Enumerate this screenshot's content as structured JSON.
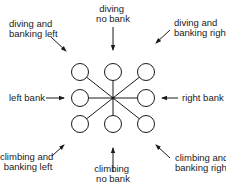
{
  "diagram": {
    "hub": {
      "x": 113,
      "y": 98
    },
    "circle_radius": 8.5,
    "stroke_color": "#1a1a1a",
    "nodes": [
      {
        "id": "tl",
        "x": 80,
        "y": 72
      },
      {
        "id": "tc",
        "x": 113,
        "y": 72
      },
      {
        "id": "tr",
        "x": 146,
        "y": 72
      },
      {
        "id": "ml",
        "x": 80,
        "y": 98
      },
      {
        "id": "mr",
        "x": 146,
        "y": 98
      },
      {
        "id": "bl",
        "x": 80,
        "y": 124
      },
      {
        "id": "bc",
        "x": 113,
        "y": 124
      },
      {
        "id": "br",
        "x": 146,
        "y": 124
      }
    ],
    "labels": {
      "diving_no_bank": [
        "diving",
        "no bank"
      ],
      "diving_banking_left": [
        "diving and",
        "banking left"
      ],
      "diving_banking_right": [
        "diving and",
        "banking right"
      ],
      "left_bank": [
        "left bank"
      ],
      "right_bank": [
        "right bank"
      ],
      "climbing_banking_left": [
        "climbing and",
        "banking left"
      ],
      "climbing_no_bank": [
        "climbing",
        "no bank"
      ],
      "climbing_banking_right": [
        "climbing and",
        "banking right"
      ]
    }
  }
}
